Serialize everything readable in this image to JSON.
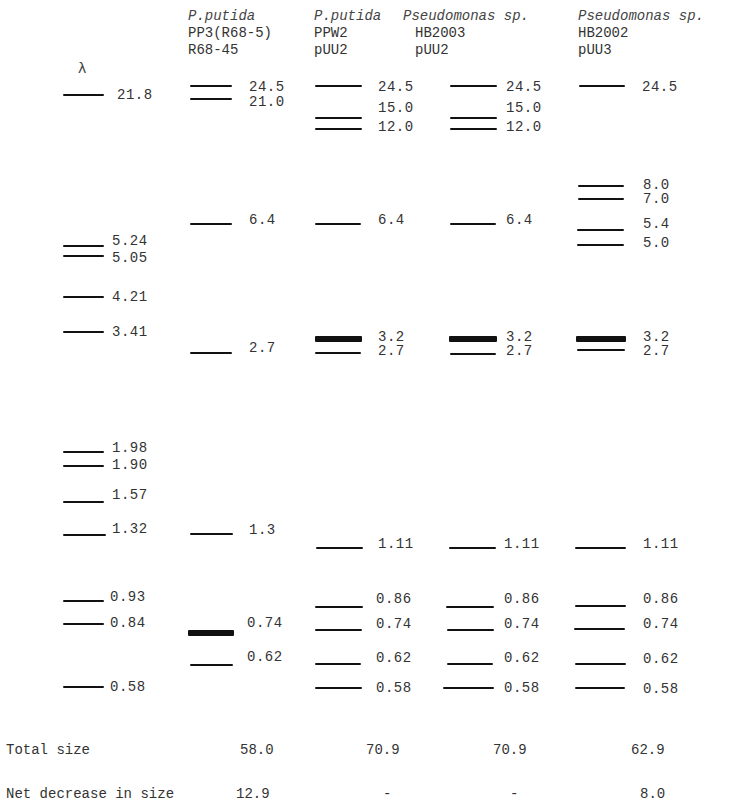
{
  "figure": {
    "marker_label": "λ"
  },
  "lanes": [
    {
      "id": "lambda",
      "header": {
        "species": "",
        "strain": "",
        "plasmid": ""
      },
      "bands": [
        {
          "size": "21.8",
          "y": 95,
          "x": 63,
          "w": 41,
          "thick": 2,
          "lx": 117,
          "ly": 88
        },
        {
          "size": "5.24",
          "y": 246,
          "x": 63,
          "w": 41,
          "thick": 2,
          "lx": 112,
          "ly": 234
        },
        {
          "size": "5.05",
          "y": 256,
          "x": 63,
          "w": 41,
          "thick": 2,
          "lx": 112,
          "ly": 251
        },
        {
          "size": "4.21",
          "y": 297,
          "x": 63,
          "w": 41,
          "thick": 2,
          "lx": 112,
          "ly": 290
        },
        {
          "size": "3.41",
          "y": 332,
          "x": 63,
          "w": 41,
          "thick": 2,
          "lx": 112,
          "ly": 325
        },
        {
          "size": "1.98",
          "y": 452,
          "x": 63,
          "w": 41,
          "thick": 2,
          "lx": 112,
          "ly": 441
        },
        {
          "size": "1.90",
          "y": 466,
          "x": 63,
          "w": 41,
          "thick": 2,
          "lx": 112,
          "ly": 458
        },
        {
          "size": "1.57",
          "y": 502,
          "x": 63,
          "w": 41,
          "thick": 2,
          "lx": 112,
          "ly": 488
        },
        {
          "size": "1.32",
          "y": 535,
          "x": 63,
          "w": 43,
          "thick": 2,
          "lx": 112,
          "ly": 522
        },
        {
          "size": "0.93",
          "y": 601,
          "x": 63,
          "w": 41,
          "thick": 2,
          "lx": 110,
          "ly": 590
        },
        {
          "size": "0.84",
          "y": 624,
          "x": 63,
          "w": 41,
          "thick": 2,
          "lx": 110,
          "ly": 616
        },
        {
          "size": "0.58",
          "y": 687,
          "x": 63,
          "w": 41,
          "thick": 2,
          "lx": 110,
          "ly": 680
        }
      ]
    },
    {
      "id": "pp3",
      "header": {
        "species": "P.putida",
        "strain": "PP3(R68-5)",
        "plasmid": "R68-45",
        "x": 187
      },
      "bands": [
        {
          "size": "24.5",
          "y": 86,
          "x": 190,
          "w": 42,
          "thick": 2,
          "lx": 249,
          "ly": 80
        },
        {
          "size": "21.0",
          "y": 99,
          "x": 190,
          "w": 42,
          "thick": 2,
          "lx": 249,
          "ly": 95
        },
        {
          "size": "6.4",
          "y": 224,
          "x": 190,
          "w": 42,
          "thick": 2,
          "lx": 249,
          "ly": 213
        },
        {
          "size": "2.7",
          "y": 353,
          "x": 190,
          "w": 42,
          "thick": 2,
          "lx": 249,
          "ly": 341
        },
        {
          "size": "1.3",
          "y": 534,
          "x": 190,
          "w": 43,
          "thick": 2,
          "lx": 249,
          "ly": 523
        },
        {
          "size": "0.74",
          "y": 633,
          "x": 188,
          "w": 46,
          "thick": 6,
          "lx": 247,
          "ly": 616
        },
        {
          "size": "0.62",
          "y": 665,
          "x": 190,
          "w": 43,
          "thick": 2,
          "lx": 247,
          "ly": 650
        }
      ]
    },
    {
      "id": "ppw2",
      "header": {
        "species": "P.putida",
        "strain": "PPW2",
        "plasmid": "pUU2",
        "x": 314
      },
      "bands": [
        {
          "size": "24.5",
          "y": 86,
          "x": 315,
          "w": 47,
          "thick": 2,
          "lx": 378,
          "ly": 80
        },
        {
          "size": "15.0",
          "y": 118,
          "x": 315,
          "w": 47,
          "thick": 2,
          "lx": 378,
          "ly": 101
        },
        {
          "size": "12.0",
          "y": 129,
          "x": 315,
          "w": 47,
          "thick": 2,
          "lx": 378,
          "ly": 120
        },
        {
          "size": "6.4",
          "y": 224,
          "x": 315,
          "w": 46,
          "thick": 2,
          "lx": 378,
          "ly": 213
        },
        {
          "size": "3.2",
          "y": 339,
          "x": 315,
          "w": 47,
          "thick": 6,
          "lx": 378,
          "ly": 330
        },
        {
          "size": "2.7",
          "y": 353,
          "x": 315,
          "w": 46,
          "thick": 2,
          "lx": 378,
          "ly": 344
        },
        {
          "size": "1.11",
          "y": 548,
          "x": 316,
          "w": 47,
          "thick": 2,
          "lx": 378,
          "ly": 537
        },
        {
          "size": "0.86",
          "y": 607,
          "x": 315,
          "w": 48,
          "thick": 2,
          "lx": 376,
          "ly": 592
        },
        {
          "size": "0.74",
          "y": 630,
          "x": 315,
          "w": 47,
          "thick": 2,
          "lx": 376,
          "ly": 617
        },
        {
          "size": "0.62",
          "y": 664,
          "x": 315,
          "w": 46,
          "thick": 2,
          "lx": 376,
          "ly": 651
        },
        {
          "size": "0.58",
          "y": 688,
          "x": 315,
          "w": 47,
          "thick": 2,
          "lx": 376,
          "ly": 681
        }
      ]
    },
    {
      "id": "hb2003",
      "header": {
        "species": "Pseudomonas sp.",
        "strain": "HB2003",
        "plasmid": "pUU2",
        "x": 403
      },
      "bands": [
        {
          "size": "24.5",
          "y": 86,
          "x": 450,
          "w": 47,
          "thick": 2,
          "lx": 506,
          "ly": 80
        },
        {
          "size": "15.0",
          "y": 118,
          "x": 450,
          "w": 47,
          "thick": 2,
          "lx": 506,
          "ly": 101
        },
        {
          "size": "12.0",
          "y": 129,
          "x": 450,
          "w": 47,
          "thick": 2,
          "lx": 506,
          "ly": 120
        },
        {
          "size": "6.4",
          "y": 224,
          "x": 450,
          "w": 46,
          "thick": 2,
          "lx": 506,
          "ly": 213
        },
        {
          "size": "3.2",
          "y": 339,
          "x": 449,
          "w": 48,
          "thick": 6,
          "lx": 506,
          "ly": 330
        },
        {
          "size": "2.7",
          "y": 354,
          "x": 450,
          "w": 46,
          "thick": 2,
          "lx": 506,
          "ly": 344
        },
        {
          "size": "1.11",
          "y": 548,
          "x": 449,
          "w": 47,
          "thick": 2,
          "lx": 504,
          "ly": 537
        },
        {
          "size": "0.86",
          "y": 607,
          "x": 446,
          "w": 48,
          "thick": 2,
          "lx": 504,
          "ly": 592
        },
        {
          "size": "0.74",
          "y": 630,
          "x": 447,
          "w": 47,
          "thick": 2,
          "lx": 504,
          "ly": 617
        },
        {
          "size": "0.62",
          "y": 664,
          "x": 447,
          "w": 46,
          "thick": 2,
          "lx": 504,
          "ly": 651
        },
        {
          "size": "0.58",
          "y": 688,
          "x": 443,
          "w": 51,
          "thick": 2,
          "lx": 504,
          "ly": 681
        }
      ]
    },
    {
      "id": "hb2002",
      "header": {
        "species": "Pseudomonas sp.",
        "strain": "HB2002",
        "plasmid": "pUU3",
        "x": 578
      },
      "bands": [
        {
          "size": "24.5",
          "y": 86,
          "x": 579,
          "w": 46,
          "thick": 2,
          "lx": 642,
          "ly": 80
        },
        {
          "size": "8.0",
          "y": 186,
          "x": 578,
          "w": 46,
          "thick": 2,
          "lx": 643,
          "ly": 178
        },
        {
          "size": "7.0",
          "y": 199,
          "x": 578,
          "w": 46,
          "thick": 2,
          "lx": 643,
          "ly": 192
        },
        {
          "size": "5.4",
          "y": 230,
          "x": 577,
          "w": 47,
          "thick": 2,
          "lx": 643,
          "ly": 217
        },
        {
          "size": "5.0",
          "y": 245,
          "x": 577,
          "w": 47,
          "thick": 2,
          "lx": 643,
          "ly": 236
        },
        {
          "size": "3.2",
          "y": 339,
          "x": 576,
          "w": 50,
          "thick": 6,
          "lx": 643,
          "ly": 330
        },
        {
          "size": "2.7",
          "y": 350,
          "x": 577,
          "w": 48,
          "thick": 2,
          "lx": 643,
          "ly": 344
        },
        {
          "size": "1.11",
          "y": 548,
          "x": 575,
          "w": 51,
          "thick": 2,
          "lx": 643,
          "ly": 537
        },
        {
          "size": "0.86",
          "y": 606,
          "x": 575,
          "w": 51,
          "thick": 2,
          "lx": 643,
          "ly": 592
        },
        {
          "size": "0.74",
          "y": 629,
          "x": 574,
          "w": 51,
          "thick": 2,
          "lx": 643,
          "ly": 617
        },
        {
          "size": "0.62",
          "y": 664,
          "x": 575,
          "w": 51,
          "thick": 2,
          "lx": 643,
          "ly": 652
        },
        {
          "size": "0.58",
          "y": 688,
          "x": 575,
          "w": 50,
          "thick": 2,
          "lx": 643,
          "ly": 682
        }
      ]
    }
  ],
  "summary": {
    "total_size": {
      "label": "Total size",
      "values": [
        "58.0",
        "70.9",
        "70.9",
        "62.9"
      ],
      "xs": [
        240,
        366,
        493,
        631
      ],
      "y": 742
    },
    "net_decrease": {
      "label": "Net decrease in size",
      "values": [
        "12.9",
        "-",
        "-",
        "8.0"
      ],
      "xs": [
        236,
        383,
        510,
        640
      ],
      "y": 786
    }
  }
}
